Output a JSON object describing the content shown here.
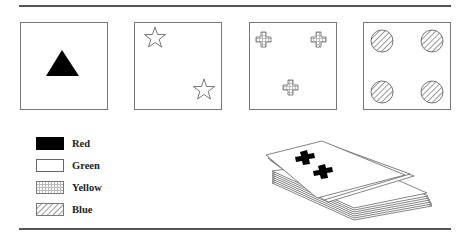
{
  "figure": {
    "cards": [
      {
        "shape": "triangle",
        "count": 1,
        "color": "Red",
        "fill": "solid-black"
      },
      {
        "shape": "star",
        "count": 2,
        "color": "Green",
        "fill": "white"
      },
      {
        "shape": "cross",
        "count": 3,
        "color": "Yellow",
        "fill": "dotted"
      },
      {
        "shape": "circle",
        "count": 4,
        "color": "Blue",
        "fill": "hatched"
      }
    ],
    "legend": [
      {
        "label": "Red",
        "pattern": "solid-black"
      },
      {
        "label": "Green",
        "pattern": "white"
      },
      {
        "label": "Yellow",
        "pattern": "dotted"
      },
      {
        "label": "Blue",
        "pattern": "hatched"
      }
    ],
    "deck": {
      "top_card_shape": "cross",
      "top_card_count": 2,
      "top_card_color": "Red"
    }
  }
}
